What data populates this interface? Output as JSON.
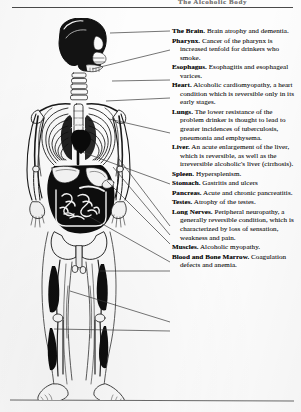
{
  "document": {
    "header_text": "The Alcoholic Body",
    "figure_alt": "Human skeleton and internal organs diagram",
    "rules": {
      "top_divider": true,
      "bottom_divider": true
    }
  },
  "diagram": {
    "figure_name": "skeleton-anatomy-figure",
    "entries": [
      {
        "id": "brain",
        "term": "The Brain.",
        "description": "Brain atrophy and dementia.",
        "anchor": {
          "x": 103,
          "y": 33
        },
        "label_y": 31
      },
      {
        "id": "pharynx",
        "term": "Pharynx.",
        "description": "Cancer of the pharynx is increased tenfold for drinkers who smoke.",
        "anchor": {
          "x": 84,
          "y": 68
        },
        "label_y": 49
      },
      {
        "id": "esophagus",
        "term": "Esophagus.",
        "description": "Esophagitis and esophageal varices.",
        "anchor": {
          "x": 105,
          "y": 80
        },
        "label_y": 79
      },
      {
        "id": "heart",
        "term": "Heart.",
        "description": "Alcoholic cardiomyopathy, a heart condition which is reversible only in its early stages.",
        "anchor": {
          "x": 99,
          "y": 100
        },
        "label_y": 97
      },
      {
        "id": "lungs",
        "term": "Lungs.",
        "description": "The lower resistance of the problem drinker is thought to lead to greater incidences of tuberculosis, pneumonia and emphysema.",
        "anchor": {
          "x": 101,
          "y": 118
        },
        "label_y": 132
      },
      {
        "id": "liver",
        "term": "Liver.",
        "description": "An acute enlargement of the liver, which is reversible, as well as the irreversible alcoholic's liver (cirrhosis).",
        "anchor": {
          "x": 74,
          "y": 151
        },
        "label_y": 183
      },
      {
        "id": "spleen",
        "term": "Spleen.",
        "description": "Hypersplenism.",
        "anchor": {
          "x": 112,
          "y": 158
        },
        "label_y": 225
      },
      {
        "id": "stomach",
        "term": "Stomach.",
        "description": "Gastritis and ulcers",
        "anchor": {
          "x": 106,
          "y": 166
        },
        "label_y": 234
      },
      {
        "id": "pancreas",
        "term": "Pancreas.",
        "description": "Acute and chronic pancreatitis.",
        "anchor": {
          "x": 100,
          "y": 180
        },
        "label_y": 243
      },
      {
        "id": "testes",
        "term": "Testes.",
        "description": "Atrophy of the testes.",
        "anchor": {
          "x": 82,
          "y": 216
        },
        "label_y": 261
      },
      {
        "id": "long-nerves",
        "term": "Long Nerves.",
        "description": "Peripheral neuropathy, a generally reversible condition, which is characterized by loss of sensation, weakness and pain.",
        "anchor": {
          "x": 93,
          "y": 270
        },
        "label_y": 270
      },
      {
        "id": "muscles",
        "term": "Muscles.",
        "description": "Alcoholic myopathy.",
        "anchor": {
          "x": 62,
          "y": 290
        },
        "label_y": 321
      },
      {
        "id": "blood-bone-marrow",
        "term": "Blood and Bone Marrow.",
        "description": "Coagulation defects and anemia.",
        "anchor": {
          "x": 46,
          "y": 328
        },
        "label_y": 330
      }
    ]
  }
}
